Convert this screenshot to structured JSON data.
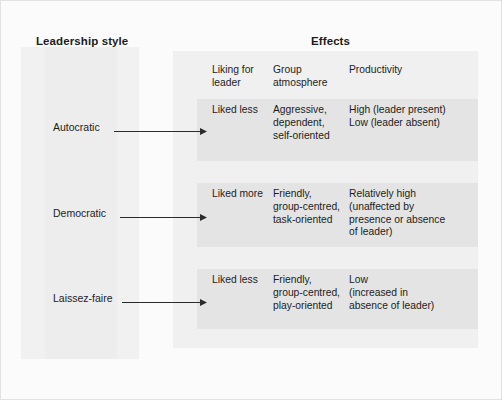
{
  "figure": {
    "headers": {
      "leadership": "Leadership style",
      "effects": "Effects"
    },
    "effect_columns": [
      "Liking for\nleader",
      "Group\natmosphere",
      "Productivity"
    ],
    "rows": [
      {
        "style": "Autocratic",
        "arrow": "arrow-right",
        "liking": "Liked less",
        "atmosphere": "Aggressive,\ndependent,\nself-oriented",
        "productivity": "High (leader present)\nLow (leader absent)"
      },
      {
        "style": "Democratic",
        "arrow": "arrow-right",
        "liking": "Liked more",
        "atmosphere": "Friendly,\ngroup-centred,\ntask-oriented",
        "productivity": "Relatively high\n(unaffected by\npresence or absence\nof leader)"
      },
      {
        "style": "Laissez-faire",
        "arrow": "arrow-right",
        "liking": "Liked less",
        "atmosphere": "Friendly,\ngroup-centred,\nplay-oriented",
        "productivity": "Low\n(increased in\nabsence of leader)"
      }
    ],
    "colors": {
      "page_background": "#fbfbfb",
      "panel_left": "#f1f1f1",
      "panel_right": "#f0f0f0",
      "row_block": "#e4e4e4",
      "text": "#1c1c1c",
      "arrow": "#2b2b2b"
    }
  }
}
